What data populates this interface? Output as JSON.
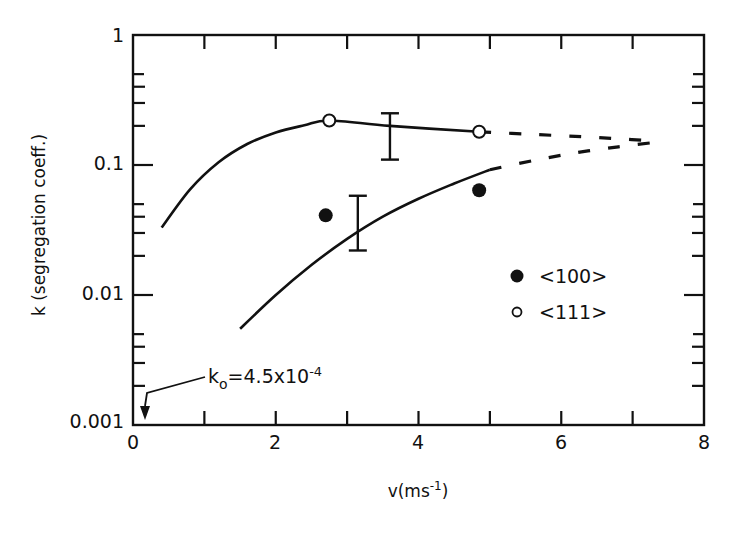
{
  "chart_data": {
    "type": "scatter",
    "title": "",
    "xlabel": "v(ms⁻¹)",
    "ylabel": "k (segregation coeff.)",
    "xlim": [
      0,
      8
    ],
    "ylim": [
      0.001,
      1
    ],
    "yscale": "log",
    "grid": false,
    "legend_position": "right-middle",
    "x_ticks": [
      0,
      2,
      4,
      6,
      8
    ],
    "x_tick_labels": [
      "0",
      "2",
      "4",
      "6",
      "8"
    ],
    "x_minor_ticks": [
      1,
      3,
      5,
      7
    ],
    "y_ticks": [
      0.001,
      0.01,
      0.1,
      1
    ],
    "y_tick_labels": [
      "0.001",
      "0.01",
      "0.1",
      "1"
    ],
    "series": [
      {
        "name": "<100>",
        "marker": "filled-circle",
        "points": [
          {
            "x": 2.7,
            "y": 0.041
          },
          {
            "x": 4.85,
            "y": 0.064
          }
        ],
        "error_bar": {
          "x": 3.15,
          "y_low": 0.022,
          "y_high": 0.058
        },
        "fit_curve_solid": [
          {
            "x": 1.5,
            "y": 0.0055
          },
          {
            "x": 2.0,
            "y": 0.01
          },
          {
            "x": 2.5,
            "y": 0.017
          },
          {
            "x": 3.0,
            "y": 0.027
          },
          {
            "x": 3.5,
            "y": 0.04
          },
          {
            "x": 4.0,
            "y": 0.055
          },
          {
            "x": 4.5,
            "y": 0.072
          },
          {
            "x": 5.0,
            "y": 0.092
          }
        ],
        "fit_curve_dashed": [
          {
            "x": 5.0,
            "y": 0.092
          },
          {
            "x": 5.6,
            "y": 0.108
          },
          {
            "x": 6.2,
            "y": 0.124
          },
          {
            "x": 6.8,
            "y": 0.138
          },
          {
            "x": 7.35,
            "y": 0.15
          }
        ]
      },
      {
        "name": "<111>",
        "marker": "open-circle",
        "points": [
          {
            "x": 2.75,
            "y": 0.22
          },
          {
            "x": 4.85,
            "y": 0.18
          }
        ],
        "error_bar": {
          "x": 3.6,
          "y_low": 0.11,
          "y_high": 0.25
        },
        "fit_curve_solid": [
          {
            "x": 0.4,
            "y": 0.033
          },
          {
            "x": 0.8,
            "y": 0.065
          },
          {
            "x": 1.2,
            "y": 0.105
          },
          {
            "x": 1.6,
            "y": 0.145
          },
          {
            "x": 2.0,
            "y": 0.178
          },
          {
            "x": 2.4,
            "y": 0.202
          },
          {
            "x": 2.75,
            "y": 0.22
          },
          {
            "x": 3.6,
            "y": 0.2
          },
          {
            "x": 4.85,
            "y": 0.18
          }
        ],
        "fit_curve_dashed": [
          {
            "x": 4.85,
            "y": 0.18
          },
          {
            "x": 5.6,
            "y": 0.172
          },
          {
            "x": 6.3,
            "y": 0.165
          },
          {
            "x": 6.9,
            "y": 0.158
          },
          {
            "x": 7.35,
            "y": 0.152
          }
        ]
      }
    ],
    "annotations": [
      {
        "text": "k₀ = 4.5×10⁻⁴",
        "arrow_to": {
          "x": 0.15,
          "y": 0.001
        }
      }
    ]
  },
  "legend": {
    "items": [
      {
        "label": "<100>",
        "marker": "filled-circle"
      },
      {
        "label": "<111>",
        "marker": "open-circle"
      }
    ]
  },
  "axes": {
    "x_title": "v(ms",
    "x_title_sup": "-1",
    "x_title_close": ")",
    "y_title": "k (segregation coeff.)",
    "y_tick_labels": [
      "1",
      "0.1",
      "0.01",
      "0.001"
    ],
    "x_tick_labels": [
      "0",
      "2",
      "4",
      "6",
      "8"
    ]
  },
  "annotation": {
    "k0_label": "k",
    "k0_sub": "o",
    "k0_value": "=4.5x10",
    "k0_exp": "-4"
  },
  "colors": {
    "ink": "#111111",
    "background": "#ffffff"
  }
}
